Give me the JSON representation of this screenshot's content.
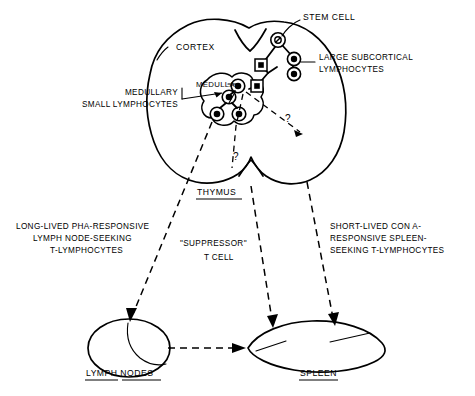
{
  "figure": {
    "domain": "diagram",
    "type": "immunology-schematic",
    "background_color": "#ffffff",
    "ink_color": "#000000",
    "width": 475,
    "height": 396
  },
  "organs": {
    "thymus": {
      "label": "THYMUS",
      "underlined": true,
      "regions": {
        "cortex": "CORTEX",
        "medulla": "MEDULLA"
      }
    },
    "lymph_nodes": {
      "label": "LYMPH NODES",
      "underlined": true
    },
    "spleen": {
      "label": "SPLEEN",
      "underlined": true
    }
  },
  "cell_labels": {
    "stem_cell": "STEM CELL",
    "large_subcortical_lymphocytes": [
      "LARGE SUBCORTICAL",
      "LYMPHOCYTES"
    ],
    "medullary_small_lymphocytes": [
      "MEDULLARY",
      "SMALL LYMPHOCYTES"
    ]
  },
  "pathway_labels": {
    "lymph_node_path": [
      "LONG-LIVED PHA-RESPONSIVE",
      "LYMPH NODE-SEEKING",
      "T-LYMPHOCYTES"
    ],
    "suppressor_path": [
      "\"SUPPRESSOR\"",
      "T CELL"
    ],
    "spleen_path": [
      "SHORT-LIVED CON A-",
      "RESPONSIVE SPLEEN-",
      "SEEKING T-LYMPHOCYTES"
    ]
  },
  "annotations": {
    "question_mark_upper": "?",
    "question_mark_lower": "?"
  }
}
